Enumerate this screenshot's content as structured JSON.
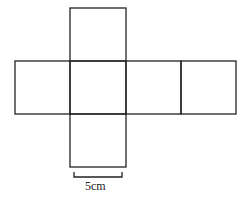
{
  "diagram": {
    "type": "cube-net",
    "square_side_label": "5cm",
    "faces": [
      {
        "name": "top",
        "x": 70,
        "y": 8,
        "w": 56,
        "h": 53
      },
      {
        "name": "left",
        "x": 15,
        "y": 61,
        "w": 55,
        "h": 53
      },
      {
        "name": "center",
        "x": 70,
        "y": 61,
        "w": 56,
        "h": 53
      },
      {
        "name": "right",
        "x": 126,
        "y": 61,
        "w": 55,
        "h": 53
      },
      {
        "name": "far-right",
        "x": 181,
        "y": 61,
        "w": 55,
        "h": 53
      },
      {
        "name": "bottom",
        "x": 70,
        "y": 114,
        "w": 56,
        "h": 53
      }
    ],
    "line_color": "#222222"
  }
}
